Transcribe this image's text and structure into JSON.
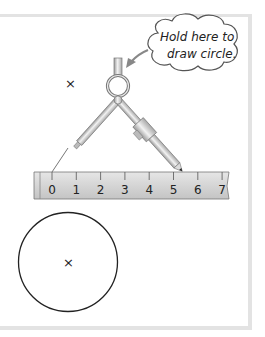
{
  "callout": {
    "line1": "Hold here to",
    "line2": "draw circle."
  },
  "marks": {
    "top_cross": "×",
    "circle_center_cross": "×"
  },
  "ruler": {
    "ticks": [
      "0",
      "1",
      "2",
      "3",
      "4",
      "5",
      "6",
      "7"
    ],
    "compass_point_at": "0",
    "pencil_at": "6"
  },
  "colors": {
    "frame": "#e3e3e3",
    "ruler_fill": "#d2d2d2",
    "metal": "#c8c8c8",
    "ink": "#222222"
  }
}
